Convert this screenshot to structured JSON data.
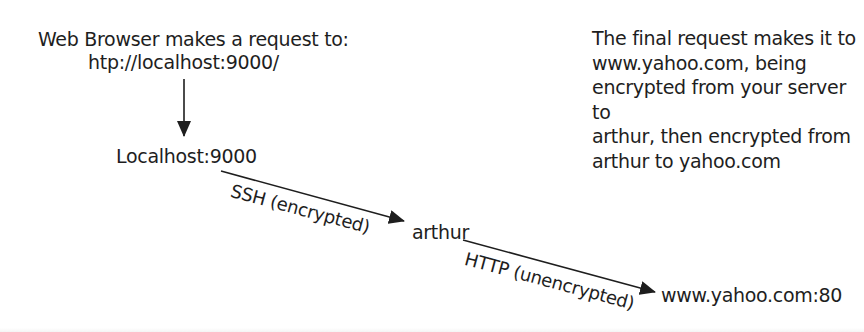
{
  "diagram": {
    "colors": {
      "ink": "#1e1e1e",
      "background": "#ffffff"
    },
    "nodes": {
      "browser_request": {
        "line1": "Web Browser makes a request to:",
        "line2": "htp://localhost:9000/"
      },
      "localhost": "Localhost:9000",
      "arthur": "arthur",
      "yahoo": "www.yahoo.com:80"
    },
    "edges": [
      {
        "from": "browser_request",
        "to": "localhost",
        "label": ""
      },
      {
        "from": "localhost",
        "to": "arthur",
        "label": "SSH (encrypted)"
      },
      {
        "from": "arthur",
        "to": "yahoo",
        "label": "HTTP (unencrypted)"
      }
    ],
    "note": {
      "lines": [
        "The final request makes it to",
        "www.yahoo.com, being",
        "encrypted from your server to",
        "arthur, then encrypted from",
        "arthur to yahoo.com"
      ]
    }
  }
}
